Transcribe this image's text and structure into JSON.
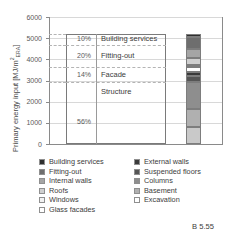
{
  "caption": "B 5.55",
  "chart_data": {
    "type": "bar",
    "title": "",
    "xlabel": "",
    "ylabel": "Primary energy input [MJ/m²ERA]",
    "ylabel_main": "Primary energy input [MJ/m",
    "ylabel_sup": "2",
    "ylabel_sub": "ERA",
    "ylabel_close": "]",
    "ylim": [
      0,
      6000
    ],
    "yticks": [
      0,
      1000,
      2000,
      3000,
      4000,
      5000,
      6000
    ],
    "ytick_labels": [
      "0",
      "1000",
      "2000",
      "3000",
      "4000",
      "5000",
      "6000"
    ],
    "grid": true,
    "legend_position": "below",
    "total": 5200,
    "groups": [
      {
        "label": "Building services",
        "pct": "10%",
        "value": 520,
        "from": 4680,
        "to": 5200
      },
      {
        "label": "Fitting-out",
        "pct": "20%",
        "value": 1040,
        "from": 3640,
        "to": 4680
      },
      {
        "label": "Facade",
        "pct": "14%",
        "value": 728,
        "from": 2912,
        "to": 3640
      },
      {
        "label": "Structure",
        "pct": "56%",
        "value": 2912,
        "from": 0,
        "to": 2912
      }
    ],
    "stack_order_bottom_up": [
      {
        "name": "Excavation",
        "value": 780,
        "color": "#c9c9c9"
      },
      {
        "name": "Basement",
        "value": 860,
        "color": "#b0b0b0"
      },
      {
        "name": "Columns",
        "value": 1272,
        "color": "#8e8e8e"
      },
      {
        "name": "Suspended floors",
        "value": 300,
        "color": "#555555"
      },
      {
        "name": "External walls",
        "value": 210,
        "color": "#3a3a3a"
      },
      {
        "name": "Glass facades",
        "value": 200,
        "color": "#ffffff"
      },
      {
        "name": "Windows",
        "value": 120,
        "color": "#f2f2f2"
      },
      {
        "name": "Roofs",
        "value": 330,
        "color": "#cfcfcf"
      },
      {
        "name": "Internal walls",
        "value": 400,
        "color": "#a5a5a5"
      },
      {
        "name": "Fitting-out",
        "value": 560,
        "color": "#6e6e6e"
      },
      {
        "name": "Building services",
        "value": 170,
        "color": "#2f2f2f"
      }
    ],
    "legend": {
      "left_column": [
        {
          "label": "Building services",
          "color": "#2f2f2f"
        },
        {
          "label": "Fitting-out",
          "color": "#6e6e6e"
        },
        {
          "label": "Internal walls",
          "color": "#a5a5a5"
        },
        {
          "label": "Roofs",
          "color": "#cfcfcf"
        },
        {
          "label": "Windows",
          "color": "#f2f2f2"
        },
        {
          "label": "Glass facades",
          "color": "#ffffff"
        }
      ],
      "right_column": [
        {
          "label": "External walls",
          "color": "#3a3a3a"
        },
        {
          "label": "Suspended floors",
          "color": "#555555"
        },
        {
          "label": "Columns",
          "color": "#8e8e8e"
        },
        {
          "label": "Basement",
          "color": "#b0b0b0"
        },
        {
          "label": "Excavation",
          "color": "#ffffff"
        }
      ]
    }
  }
}
